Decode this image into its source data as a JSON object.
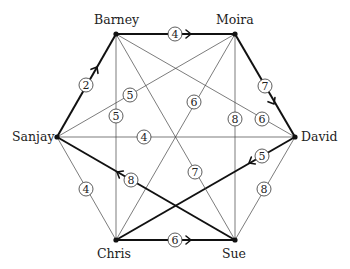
{
  "diagram": {
    "type": "weighted-graph",
    "nodes": [
      {
        "id": "barney",
        "label": "Barney",
        "x": 116,
        "y": 34,
        "lx": 94,
        "ly": 24
      },
      {
        "id": "moira",
        "label": "Moira",
        "x": 235,
        "y": 34,
        "lx": 216,
        "ly": 24
      },
      {
        "id": "sanjay",
        "label": "Sanjay",
        "x": 57,
        "y": 137,
        "lx": 12,
        "ly": 141
      },
      {
        "id": "david",
        "label": "David",
        "x": 295,
        "y": 137,
        "lx": 301,
        "ly": 141
      },
      {
        "id": "chris",
        "label": "Chris",
        "x": 116,
        "y": 240,
        "lx": 97,
        "ly": 258
      },
      {
        "id": "sue",
        "label": "Sue",
        "x": 235,
        "y": 240,
        "lx": 222,
        "ly": 258
      }
    ],
    "edges": [
      {
        "from": "barney",
        "to": "moira",
        "weight": "4",
        "bold": true,
        "directed": true,
        "lx": 175,
        "ly": 34,
        "ax": 191,
        "ay": 34
      },
      {
        "from": "sanjay",
        "to": "barney",
        "weight": "2",
        "bold": true,
        "directed": true,
        "lx": 86,
        "ly": 85,
        "ax": 97,
        "ay": 67
      },
      {
        "from": "moira",
        "to": "david",
        "weight": "7",
        "bold": true,
        "directed": true,
        "lx": 265,
        "ly": 86,
        "ax": 274,
        "ay": 104
      },
      {
        "from": "barney",
        "to": "chris",
        "weight": "5",
        "bold": false,
        "lx": 116,
        "ly": 116
      },
      {
        "from": "moira",
        "to": "sanjay",
        "weight": "5",
        "bold": false,
        "lx": 130,
        "ly": 95
      },
      {
        "from": "moira",
        "to": "chris",
        "weight": "6",
        "bold": false,
        "lx": 194,
        "ly": 102
      },
      {
        "from": "moira",
        "to": "sue",
        "weight": "8",
        "bold": false,
        "lx": 235,
        "ly": 119
      },
      {
        "from": "barney",
        "to": "david",
        "weight": "6",
        "bold": false,
        "lx": 262,
        "ly": 119
      },
      {
        "from": "sanjay",
        "to": "david",
        "weight": "4",
        "bold": false,
        "lx": 144,
        "ly": 137
      },
      {
        "from": "david",
        "to": "chris",
        "weight": "5",
        "bold": true,
        "directed": true,
        "lx": 262,
        "ly": 156,
        "ax": 249,
        "ay": 163
      },
      {
        "from": "sanjay",
        "to": "chris",
        "weight": "4",
        "bold": false,
        "lx": 86,
        "ly": 189
      },
      {
        "from": "sue",
        "to": "sanjay",
        "weight": "8",
        "bold": true,
        "directed": true,
        "lx": 131,
        "ly": 180,
        "ax": 117,
        "ay": 172
      },
      {
        "from": "barney",
        "to": "sue",
        "weight": "7",
        "bold": false,
        "lx": 195,
        "ly": 172
      },
      {
        "from": "david",
        "to": "sue",
        "weight": "8",
        "bold": false,
        "lx": 264,
        "ly": 189
      },
      {
        "from": "chris",
        "to": "sue",
        "weight": "6",
        "bold": true,
        "directed": true,
        "lx": 175,
        "ly": 240,
        "ax": 191,
        "ay": 240
      }
    ]
  }
}
